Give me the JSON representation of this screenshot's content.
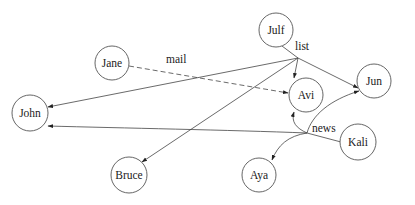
{
  "diagram": {
    "type": "directed-hypergraph",
    "nodes": [
      {
        "id": "jane",
        "label": "Jane",
        "x": 112,
        "y": 63,
        "r": 17
      },
      {
        "id": "julf",
        "label": "Julf",
        "x": 276,
        "y": 30,
        "r": 17
      },
      {
        "id": "jun",
        "label": "Jun",
        "x": 374,
        "y": 81,
        "r": 17
      },
      {
        "id": "avi",
        "label": "Avi",
        "x": 306,
        "y": 95,
        "r": 17
      },
      {
        "id": "john",
        "label": "John",
        "x": 30,
        "y": 113,
        "r": 18
      },
      {
        "id": "bruce",
        "label": "Bruce",
        "x": 129,
        "y": 175,
        "r": 18
      },
      {
        "id": "aya",
        "label": "Aya",
        "x": 259,
        "y": 175,
        "r": 17
      },
      {
        "id": "kali",
        "label": "Kali",
        "x": 358,
        "y": 142,
        "r": 18
      }
    ],
    "edge_labels": {
      "mail": "mail",
      "list": "list",
      "news": "news"
    },
    "hyperedges": [
      {
        "label": "mail",
        "style": "dashed",
        "from": [
          "jane"
        ],
        "to": [
          "avi"
        ]
      },
      {
        "label": "list",
        "style": "solid",
        "from": [
          "julf"
        ],
        "to": [
          "john",
          "avi",
          "jun",
          "bruce"
        ]
      },
      {
        "label": "news",
        "style": "solid",
        "from": [
          "kali"
        ],
        "to": [
          "john",
          "avi",
          "jun",
          "aya"
        ]
      }
    ]
  }
}
